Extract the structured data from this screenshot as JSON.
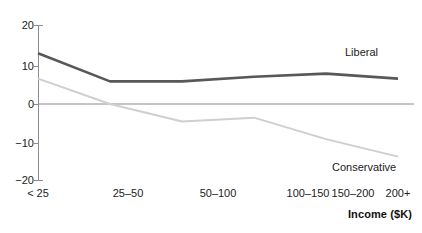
{
  "chart_data": {
    "type": "line",
    "title": "",
    "xlabel": "Income ($K)",
    "ylabel": "",
    "categories": [
      "< 25",
      "25–50",
      "50–100",
      "100–150",
      "150–200",
      "200+"
    ],
    "ylim": [
      -20,
      20
    ],
    "yticks": [
      20,
      10,
      0,
      -10,
      -20
    ],
    "ytick_labels": [
      "20",
      "10",
      "0",
      "−10",
      "−20"
    ],
    "grid": false,
    "zero_line": true,
    "legend": "inline-labels",
    "series": [
      {
        "name": "Liberal",
        "color": "#58585a",
        "width": 2.6,
        "values": [
          13.0,
          5.8,
          5.8,
          7.0,
          7.8,
          6.5
        ]
      },
      {
        "name": "Conservative",
        "color": "#cfcfcf",
        "width": 2.0,
        "values": [
          6.5,
          0.0,
          -4.5,
          -3.5,
          -9.0,
          -13.5
        ]
      }
    ]
  },
  "axes": {
    "y_axis_color": "#8c8c8c",
    "zero_line_color": "#8a8a8a"
  },
  "header": {
    "clipped_caption": ""
  }
}
